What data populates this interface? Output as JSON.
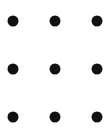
{
  "grid": {
    "rows": 3,
    "cols": 3,
    "color": "#111111",
    "dots": [
      {
        "x": 13,
        "y": 21
      },
      {
        "x": 55,
        "y": 21
      },
      {
        "x": 97,
        "y": 21
      },
      {
        "x": 13,
        "y": 69
      },
      {
        "x": 55,
        "y": 69
      },
      {
        "x": 97,
        "y": 69
      },
      {
        "x": 13,
        "y": 117
      },
      {
        "x": 55,
        "y": 117
      },
      {
        "x": 97,
        "y": 117
      }
    ]
  }
}
